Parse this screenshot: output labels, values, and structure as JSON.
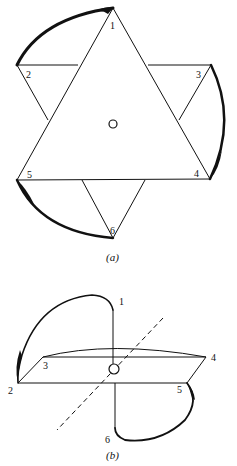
{
  "figure_a": {
    "caption": "(a)",
    "vertex_labels": [
      "1",
      "2",
      "3",
      "4",
      "5",
      "6"
    ],
    "description": "Hexagram formed by two overlapping equilateral triangles (1-4-5 and 2-3-6 style star), with thick curved arcs connecting 1→2, 3→4, 5→6 around the outside, and a small circle at the center."
  },
  "figure_b": {
    "caption": "(b)",
    "vertex_labels": [
      "1",
      "2",
      "3",
      "4",
      "5",
      "6"
    ],
    "description": "Perspective view of the folded configuration: a horizontal plane 2-3-4-5 with curved loops from 1 down to 2 and from 5 around to 6, a vertical line through the central circle, and a dashed diagonal axis."
  },
  "colors": {
    "ink": "#111111",
    "background": "#ffffff"
  }
}
